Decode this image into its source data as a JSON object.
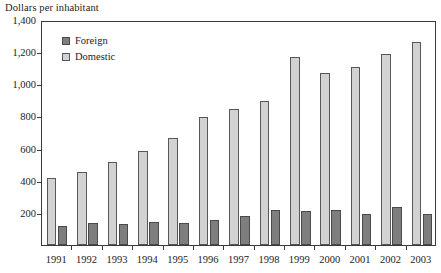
{
  "chart_data": {
    "type": "bar",
    "title": "Dollars per inhabitant",
    "xlabel": "",
    "ylabel": "",
    "ylim": [
      0,
      1400
    ],
    "ytick_labels": [
      "1,400",
      "1,200",
      "1,000",
      "800",
      "600",
      "400",
      "200"
    ],
    "ytick_values": [
      1400,
      1200,
      1000,
      800,
      600,
      400,
      200
    ],
    "ytick_interval": 200,
    "grid": false,
    "legend_position": "upper-left-inside",
    "categories": [
      "1991",
      "1992",
      "1993",
      "1994",
      "1995",
      "1996",
      "1997",
      "1998",
      "1999",
      "2000",
      "2001",
      "2002",
      "2003"
    ],
    "series": [
      {
        "name": "Foreign",
        "color": "#7e7e7e",
        "draw_order": 2,
        "values": [
          120,
          140,
          130,
          143,
          138,
          158,
          178,
          218,
          210,
          215,
          195,
          235,
          190
        ]
      },
      {
        "name": "Domestic",
        "color": "#d2d2d2",
        "draw_order": 1,
        "values": [
          415,
          455,
          515,
          583,
          668,
          795,
          848,
          893,
          1170,
          1068,
          1110,
          1190,
          1265
        ]
      }
    ]
  },
  "legend": {
    "items": [
      {
        "label": "Foreign",
        "swatch": "foreign"
      },
      {
        "label": "Domestic",
        "swatch": "domestic"
      }
    ]
  }
}
